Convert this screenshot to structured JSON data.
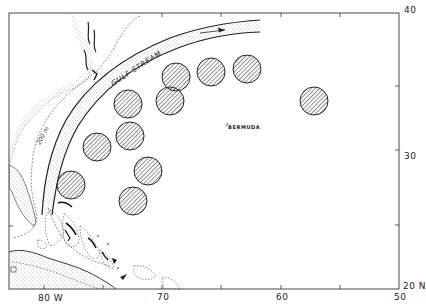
{
  "map": {
    "region": "Western North Atlantic",
    "labels": {
      "gulf_stream": "GULF STREAM",
      "isobath": "200 m",
      "bermuda": "BERMUDA"
    },
    "axes": {
      "longitude_ticks": [
        {
          "label": "80 W",
          "value": 80
        },
        {
          "label": "70",
          "value": 70
        },
        {
          "label": "60",
          "value": 60
        },
        {
          "label": "50",
          "value": 50
        }
      ],
      "latitude_ticks": [
        {
          "label": "40",
          "value": 40
        },
        {
          "label": "30",
          "value": 30
        },
        {
          "label": "20 N",
          "value": 20
        }
      ]
    },
    "sample_areas_count": 11,
    "colors": {
      "ink": "#222222",
      "background": "#ffffff"
    }
  }
}
